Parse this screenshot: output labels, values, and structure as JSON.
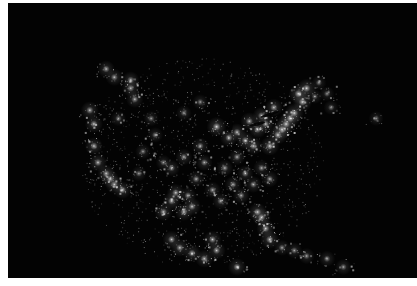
{
  "image": {
    "subject": "Night-time satellite view of North America city lights (continental United States, southern Canada, Mexico, Caribbean)",
    "background_color": "#030303",
    "light_color": "#ffffff",
    "glow_color": "#d8d8d8",
    "regions": [
      {
        "name": "northeast-megalopolis",
        "brightness": 0.95,
        "points": [
          [
            0.7,
            0.4
          ],
          [
            0.72,
            0.36
          ],
          [
            0.68,
            0.44
          ],
          [
            0.66,
            0.48
          ],
          [
            0.64,
            0.52
          ],
          [
            0.71,
            0.33
          ],
          [
            0.73,
            0.31
          ],
          [
            0.67,
            0.46
          ],
          [
            0.69,
            0.42
          ]
        ]
      },
      {
        "name": "great-lakes",
        "brightness": 0.85,
        "points": [
          [
            0.56,
            0.47
          ],
          [
            0.61,
            0.46
          ],
          [
            0.58,
            0.5
          ],
          [
            0.63,
            0.44
          ],
          [
            0.6,
            0.52
          ],
          [
            0.54,
            0.49
          ],
          [
            0.62,
            0.41
          ],
          [
            0.65,
            0.38
          ],
          [
            0.59,
            0.43
          ]
        ]
      },
      {
        "name": "chicago",
        "brightness": 1.0,
        "points": [
          [
            0.51,
            0.45
          ]
        ]
      },
      {
        "name": "midwest-south",
        "brightness": 0.75,
        "points": [
          [
            0.48,
            0.58
          ],
          [
            0.53,
            0.6
          ],
          [
            0.46,
            0.64
          ],
          [
            0.5,
            0.68
          ],
          [
            0.55,
            0.66
          ],
          [
            0.58,
            0.62
          ],
          [
            0.44,
            0.7
          ],
          [
            0.52,
            0.72
          ],
          [
            0.57,
            0.7
          ],
          [
            0.6,
            0.66
          ],
          [
            0.47,
            0.52
          ],
          [
            0.43,
            0.56
          ],
          [
            0.4,
            0.6
          ],
          [
            0.56,
            0.56
          ],
          [
            0.62,
            0.6
          ],
          [
            0.64,
            0.64
          ]
        ]
      },
      {
        "name": "texas",
        "brightness": 0.85,
        "points": [
          [
            0.4,
            0.72
          ],
          [
            0.43,
            0.76
          ],
          [
            0.38,
            0.76
          ],
          [
            0.45,
            0.74
          ],
          [
            0.41,
            0.69
          ]
        ]
      },
      {
        "name": "florida",
        "brightness": 0.9,
        "points": [
          [
            0.62,
            0.78
          ],
          [
            0.63,
            0.82
          ],
          [
            0.64,
            0.86
          ],
          [
            0.61,
            0.76
          ]
        ]
      },
      {
        "name": "west-coast",
        "brightness": 0.85,
        "points": [
          [
            0.2,
            0.39
          ],
          [
            0.21,
            0.44
          ],
          [
            0.22,
            0.58
          ],
          [
            0.24,
            0.62
          ],
          [
            0.26,
            0.66
          ],
          [
            0.28,
            0.68
          ],
          [
            0.21,
            0.52
          ],
          [
            0.25,
            0.64
          ]
        ]
      },
      {
        "name": "pacific-northwest",
        "brightness": 0.8,
        "points": [
          [
            0.24,
            0.24
          ],
          [
            0.26,
            0.27
          ],
          [
            0.3,
            0.31
          ],
          [
            0.31,
            0.35
          ],
          [
            0.3,
            0.28
          ]
        ]
      },
      {
        "name": "mountain-west",
        "brightness": 0.65,
        "points": [
          [
            0.33,
            0.54
          ],
          [
            0.36,
            0.48
          ],
          [
            0.32,
            0.62
          ],
          [
            0.38,
            0.58
          ],
          [
            0.27,
            0.42
          ],
          [
            0.35,
            0.42
          ],
          [
            0.47,
            0.36
          ],
          [
            0.43,
            0.4
          ]
        ]
      },
      {
        "name": "mexico",
        "brightness": 0.85,
        "points": [
          [
            0.45,
            0.91
          ],
          [
            0.42,
            0.89
          ],
          [
            0.48,
            0.93
          ],
          [
            0.51,
            0.9
          ],
          [
            0.56,
            0.96
          ],
          [
            0.4,
            0.86
          ],
          [
            0.5,
            0.86
          ]
        ]
      },
      {
        "name": "caribbean",
        "brightness": 0.7,
        "points": [
          [
            0.67,
            0.89
          ],
          [
            0.73,
            0.92
          ],
          [
            0.78,
            0.93
          ],
          [
            0.82,
            0.96
          ],
          [
            0.7,
            0.9
          ]
        ]
      },
      {
        "name": "canada-east",
        "brightness": 0.6,
        "points": [
          [
            0.75,
            0.34
          ],
          [
            0.79,
            0.38
          ],
          [
            0.78,
            0.33
          ],
          [
            0.9,
            0.42
          ],
          [
            0.76,
            0.29
          ]
        ]
      }
    ]
  }
}
